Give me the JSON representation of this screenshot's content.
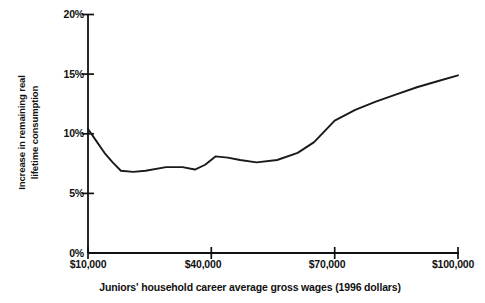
{
  "chart_data": {
    "type": "line",
    "title": "",
    "subtitle": "",
    "xlabel": "Juniors' household career average gross wages (1996 dollars)",
    "ylabel": "Increase in remaining real lifetime consumption",
    "ylabel_lines": [
      "Increase in remaining real",
      "lifetime consumption"
    ],
    "xlim": [
      10000,
      100000
    ],
    "ylim": [
      0,
      20
    ],
    "grid": false,
    "legend": null,
    "x_unit": "dollars",
    "y_unit": "percent",
    "x_tick_labels": [
      "$10,000",
      "$40,000",
      "$70,000",
      "$100,000"
    ],
    "x_ticks": [
      10000,
      40000,
      70000,
      100000
    ],
    "y_tick_labels": [
      "0%",
      "5%",
      "10%",
      "15%",
      "20%"
    ],
    "y_ticks": [
      0,
      5,
      10,
      15,
      20
    ],
    "series": [
      {
        "name": "Increase in remaining real lifetime consumption",
        "color": "#1a1a1a",
        "x": [
          10000,
          12000,
          14000,
          16000,
          18000,
          21000,
          24000,
          29000,
          33000,
          36000,
          38500,
          41000,
          44000,
          47000,
          51000,
          56000,
          61000,
          65000,
          70000,
          75000,
          80000,
          85000,
          90000,
          95000,
          100000
        ],
        "y": [
          10.4,
          9.4,
          8.4,
          7.6,
          6.9,
          6.8,
          6.9,
          7.2,
          7.2,
          7.0,
          7.4,
          8.1,
          8.0,
          7.8,
          7.6,
          7.8,
          8.4,
          9.3,
          11.1,
          12.0,
          12.7,
          13.3,
          13.9,
          14.4,
          14.9
        ]
      }
    ],
    "annotations": []
  },
  "axis": {
    "y_title_line1": "Increase in remaining real",
    "y_title_line2": "lifetime consumption",
    "x_title": "Juniors' household career average gross wages (1996 dollars)",
    "y_labels": [
      "20%",
      "15%",
      "10%",
      "5%",
      "0%"
    ],
    "x_labels": [
      "$10,000",
      "$40,000",
      "$70,000",
      "$100,000"
    ]
  },
  "style": {
    "axis_color": "#111111",
    "line_color": "#1a1a1a",
    "background": "#ffffff"
  }
}
